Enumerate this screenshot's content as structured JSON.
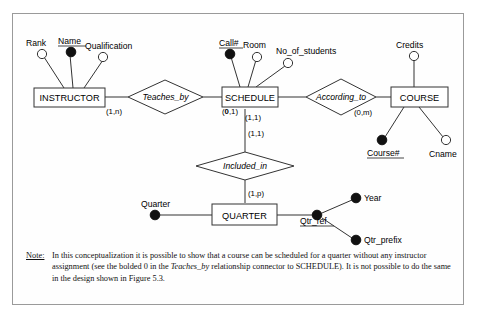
{
  "figure": {
    "title_note_label": "Note:",
    "note_text_part1": "In this conceptualization it is possible to show that a course can be scheduled for a quarter without any instructor assignment (see the bolded 0 in the ",
    "note_emphasis": "Teaches_by",
    "note_text_part2": " relationship connector to SCHEDULE).  It is not possible to do the same in the design shown in Figure 5.3."
  },
  "entities": [
    {
      "name": "INSTRUCTOR",
      "id": "instructor"
    },
    {
      "name": "SCHEDULE",
      "id": "schedule"
    },
    {
      "name": "COURSE",
      "id": "course"
    },
    {
      "name": "QUARTER",
      "id": "quarter"
    }
  ],
  "relationships": [
    {
      "name": "Teaches_by",
      "id": "teaches-by"
    },
    {
      "name": "According_to",
      "id": "according-to"
    },
    {
      "name": "Included_in",
      "id": "included-in"
    }
  ],
  "attributes": [
    {
      "label": "Rank",
      "key": false,
      "owner": "INSTRUCTOR"
    },
    {
      "label": "Name",
      "key": true,
      "owner": "INSTRUCTOR"
    },
    {
      "label": "Qualification",
      "key": false,
      "owner": "INSTRUCTOR"
    },
    {
      "label": "Call#",
      "key": true,
      "owner": "SCHEDULE"
    },
    {
      "label": "Room",
      "key": false,
      "owner": "SCHEDULE"
    },
    {
      "label": "No_of_students",
      "key": false,
      "owner": "SCHEDULE"
    },
    {
      "label": "Credits",
      "key": false,
      "owner": "COURSE"
    },
    {
      "label": "Course#",
      "key": true,
      "owner": "COURSE"
    },
    {
      "label": "Cname",
      "key": false,
      "owner": "COURSE"
    },
    {
      "label": "Quarter",
      "key": true,
      "owner": "QUARTER"
    },
    {
      "label": "Qtr_ref",
      "key": true,
      "owner": "QUARTER"
    },
    {
      "label": "Year",
      "key": true,
      "owner": "Qtr_ref"
    },
    {
      "label": "Qtr_prefix",
      "key": true,
      "owner": "Qtr_ref"
    }
  ],
  "cardinalities": [
    {
      "id": "instructor-teaches-by",
      "value": "(1,n)"
    },
    {
      "id": "teaches-by-schedule",
      "value_bold": "0",
      "prefix": "(",
      "suffix": ",1)"
    },
    {
      "id": "schedule-according-to",
      "value": "(1,1)"
    },
    {
      "id": "according-to-course",
      "value": "(0,m)"
    },
    {
      "id": "schedule-included-in",
      "value": "(1,1)"
    },
    {
      "id": "included-in-quarter",
      "value": "(1,p)"
    }
  ],
  "colors": {
    "line": "#333333",
    "frame": "#9a9a9a",
    "background": "#ffffff",
    "text": "#000000"
  }
}
